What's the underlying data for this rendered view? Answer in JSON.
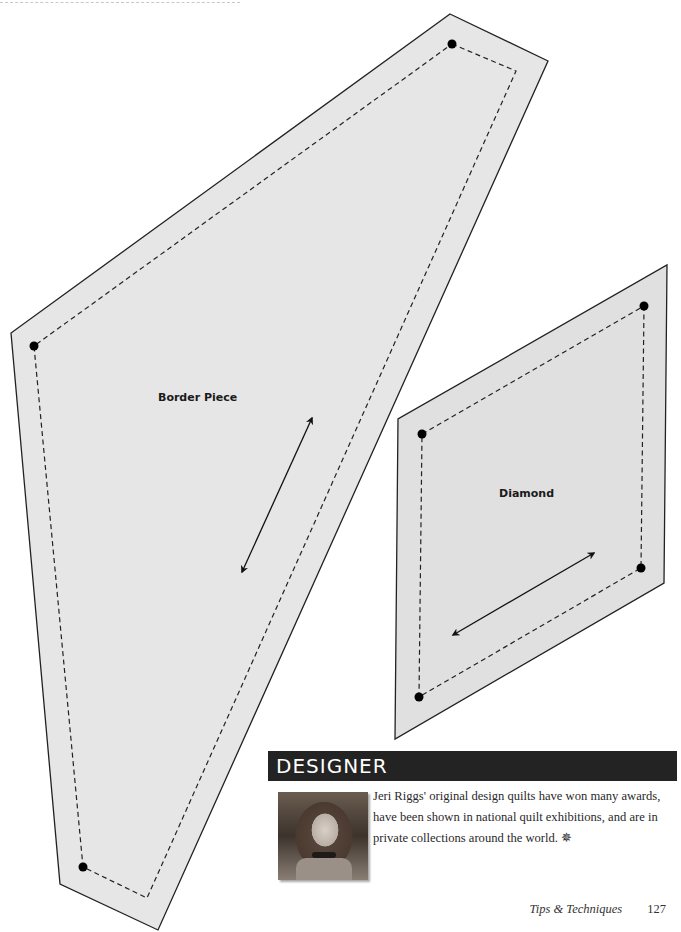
{
  "page": {
    "header_rule": "dashed",
    "templates": [
      {
        "label": "Border Piece",
        "fill": "#e6e6e6",
        "outer_polygon": [
          [
            450,
            14
          ],
          [
            548,
            61
          ],
          [
            158,
            930
          ],
          [
            60,
            884
          ],
          [
            11,
            333
          ]
        ],
        "seam_polygon": [
          [
            452,
            44
          ],
          [
            516,
            71
          ],
          [
            147,
            898
          ],
          [
            83,
            867
          ],
          [
            34,
            346
          ]
        ],
        "dots": [
          [
            452,
            44
          ],
          [
            34,
            346
          ],
          [
            83,
            867
          ]
        ],
        "grain_arrow": {
          "from": [
            312,
            418
          ],
          "to": [
            242,
            572
          ]
        },
        "label_pos": [
          158,
          401
        ]
      },
      {
        "label": "Diamond",
        "fill": "#e0e0e0",
        "outer_polygon": [
          [
            667,
            265
          ],
          [
            664,
            583
          ],
          [
            395,
            739
          ],
          [
            398,
            419
          ]
        ],
        "seam_polygon": [
          [
            644,
            306
          ],
          [
            641,
            568
          ],
          [
            419,
            697
          ],
          [
            422,
            434
          ]
        ],
        "dots": [
          [
            644,
            306
          ],
          [
            641,
            568
          ],
          [
            419,
            697
          ],
          [
            422,
            434
          ]
        ],
        "grain_arrow": {
          "from": [
            453,
            635
          ],
          "to": [
            594,
            553
          ]
        },
        "label_pos": [
          499,
          497
        ]
      }
    ]
  },
  "designer": {
    "heading": "DESIGNER",
    "bio": "Jeri Riggs' original design quilts have won many awards, have been shown in national quilt exhibitions, and are in private collections around the world. ✵",
    "photo_alt": "Portrait of Jeri Riggs"
  },
  "footer": {
    "section_title": "Tips & Techniques",
    "page_number": "127"
  }
}
